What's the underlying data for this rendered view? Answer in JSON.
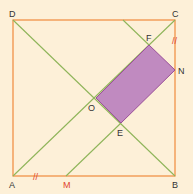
{
  "diagram": {
    "type": "geometry-square",
    "colors": {
      "background": "#fdf0d8",
      "square": "#f08a3c",
      "lines": "#8fb55a",
      "rectangle_fill": "#c08ac0",
      "rectangle_stroke": "#9a4f9a",
      "label": "#333333",
      "label_highlight": "#e0452b",
      "tick_marks": "#e0452b"
    },
    "labels": {
      "A": "A",
      "B": "B",
      "C": "C",
      "D": "D",
      "O": "O",
      "E": "E",
      "F": "F",
      "N": "N",
      "M": "M"
    },
    "tick_marks": {
      "AM": "//",
      "CN": "//"
    }
  }
}
